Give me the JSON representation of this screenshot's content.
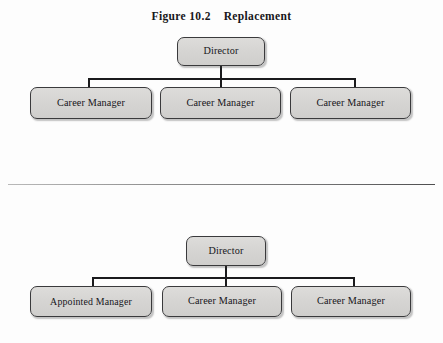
{
  "figure": {
    "title": "Figure 10.2    Replacement",
    "colors": {
      "box_fill": "#d6d5d3",
      "box_border": "#3a3a3c",
      "connector": "#1b1b1d",
      "text": "#16151a",
      "divider": "#8f8f8f",
      "background": "#fdfdfd"
    }
  },
  "diagrams": [
    {
      "name": "top-org-chart",
      "root": {
        "label": "Director"
      },
      "children": [
        {
          "label": "Career Manager"
        },
        {
          "label": "Career Manager"
        },
        {
          "label": "Career Manager"
        }
      ]
    },
    {
      "name": "bottom-org-chart",
      "root": {
        "label": "Director"
      },
      "children": [
        {
          "label": "Appointed Manager"
        },
        {
          "label": "Career Manager"
        },
        {
          "label": "Career Manager"
        }
      ]
    }
  ]
}
